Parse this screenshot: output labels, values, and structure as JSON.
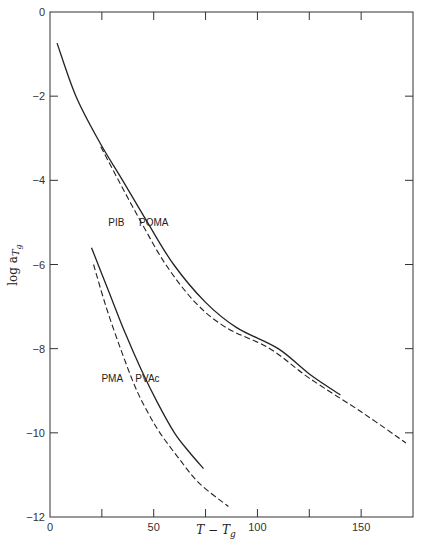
{
  "chart_data": {
    "type": "line",
    "title": "",
    "xlabel": "T − T_g",
    "ylabel": "log a_Tg",
    "xlim": [
      0,
      175
    ],
    "ylim": [
      -12,
      0
    ],
    "grid": false,
    "legend": "inline labels",
    "x_ticks": [
      0,
      25,
      50,
      75,
      100,
      125,
      150,
      175
    ],
    "x_tick_labels": [
      "0",
      "",
      "50",
      "",
      "100",
      "",
      "150",
      ""
    ],
    "y_ticks": [
      0,
      -2,
      -4,
      -6,
      -8,
      -10,
      -12
    ],
    "y_tick_labels": [
      "0",
      "−2",
      "−4",
      "−6",
      "−8",
      "−10",
      "−12"
    ],
    "series": [
      {
        "name": "POMA",
        "style": "solid",
        "label_pos": [
          50,
          -5.0
        ],
        "x": [
          3.4,
          12.5,
          24,
          35,
          47,
          59.6,
          75,
          90,
          110,
          125,
          140
        ],
        "y": [
          -0.74,
          -2.0,
          -3.1,
          -4.0,
          -5.0,
          -6.0,
          -6.9,
          -7.5,
          -8.0,
          -8.6,
          -9.1
        ]
      },
      {
        "name": "PIB",
        "style": "dashed",
        "label_pos": [
          32,
          -5.0
        ],
        "x": [
          24.5,
          33,
          44,
          55.8,
          70,
          85,
          106,
          125,
          150,
          171.6
        ],
        "y": [
          -3.2,
          -4.0,
          -5.0,
          -6.0,
          -6.9,
          -7.5,
          -8.0,
          -8.7,
          -9.5,
          -10.24
        ]
      },
      {
        "name": "PVAc",
        "style": "solid",
        "label_pos": [
          47,
          -8.7
        ],
        "x": [
          20,
          28,
          36,
          44,
          52,
          60,
          67,
          74
        ],
        "y": [
          -5.6,
          -6.6,
          -7.6,
          -8.5,
          -9.3,
          -10.0,
          -10.45,
          -10.85
        ]
      },
      {
        "name": "PMA",
        "style": "dashed",
        "label_pos": [
          30,
          -8.7
        ],
        "x": [
          21,
          27,
          34,
          41,
          47,
          53,
          62,
          72,
          86
        ],
        "y": [
          -6.0,
          -7.0,
          -8.0,
          -8.9,
          -9.5,
          -10.0,
          -10.6,
          -11.2,
          -11.75
        ]
      }
    ]
  },
  "axes": {
    "xlabel_main": "T − T",
    "xlabel_sub": "g",
    "ylabel_main": "log a",
    "ylabel_sub": "T",
    "ylabel_subsub": "g"
  }
}
